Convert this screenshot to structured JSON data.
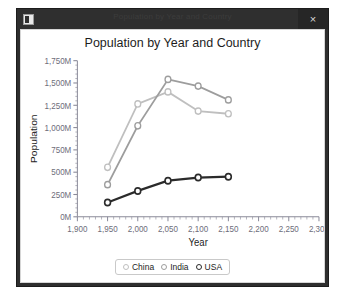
{
  "window": {
    "title": "Population by Year and Country",
    "icon_name": "app-icon",
    "close_label": "×"
  },
  "chart_data": {
    "type": "line",
    "title": "Population by Year and Country",
    "xlabel": "Year",
    "ylabel": "Population",
    "xlim": [
      1900,
      2300
    ],
    "ylim": [
      0,
      1750
    ],
    "grid": false,
    "legend_position": "bottom",
    "x": [
      1950,
      2000,
      2050,
      2100,
      2150
    ],
    "xtick_labels": [
      "1,900",
      "1,950",
      "2,000",
      "2,050",
      "2,100",
      "2,150",
      "2,200",
      "2,250",
      "2,300"
    ],
    "xtick_values": [
      1900,
      1950,
      2000,
      2050,
      2100,
      2150,
      2200,
      2250,
      2300
    ],
    "ytick_labels": [
      "0M",
      "250M",
      "500M",
      "750M",
      "1,000M",
      "1,250M",
      "1,500M",
      "1,750M"
    ],
    "ytick_values": [
      0,
      250,
      500,
      750,
      1000,
      1250,
      1500,
      1750
    ],
    "minor_tick_divisions": 5,
    "series": [
      {
        "name": "China",
        "color": "#bfbfbf",
        "values": [
          555,
          1265,
          1400,
          1185,
          1155
        ]
      },
      {
        "name": "India",
        "color": "#9d9d9d",
        "values": [
          360,
          1020,
          1540,
          1465,
          1310
        ]
      },
      {
        "name": "USA",
        "color": "#2b2b2b",
        "values": [
          160,
          290,
          405,
          440,
          450
        ]
      }
    ]
  },
  "legend": {
    "items": [
      {
        "label": "China",
        "color": "#bfbfbf"
      },
      {
        "label": "India",
        "color": "#9d9d9d"
      },
      {
        "label": "USA",
        "color": "#2b2b2b"
      }
    ]
  },
  "colors": {
    "axis": "#8a8a99",
    "tick_text": "#6d6d7a",
    "title_text": "#1d1d1d",
    "window_chrome": "#2e2e2e"
  }
}
